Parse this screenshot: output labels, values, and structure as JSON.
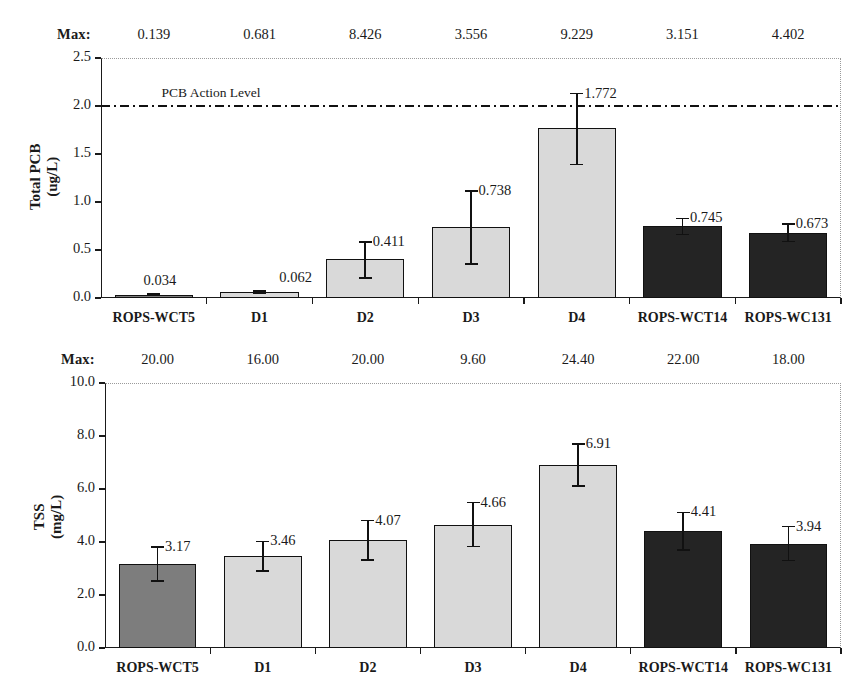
{
  "chart_data": [
    {
      "type": "bar",
      "id": "total-pcb",
      "title": "",
      "xlabel": "",
      "ylabel": "Total PCB (ug/L)",
      "ylabel_line1": "Total PCB",
      "ylabel_line2": "(ug/L)",
      "units": "ug/L",
      "ylim": [
        0.0,
        2.5
      ],
      "ytick_labels": [
        "0.0",
        "0.5",
        "1.0",
        "1.5",
        "2.0",
        "2.5"
      ],
      "ytick_values": [
        0.0,
        0.5,
        1.0,
        1.5,
        2.0,
        2.5
      ],
      "grid": false,
      "legend": "none",
      "max_row_label": "Max:",
      "max_values": [
        "0.139",
        "0.681",
        "8.426",
        "3.556",
        "9.229",
        "3.151",
        "4.402"
      ],
      "categories": [
        "ROPS-WCT5",
        "D1",
        "D2",
        "D3",
        "D4",
        "ROPS-WCT14",
        "ROPS-WC131"
      ],
      "values": [
        0.034,
        0.062,
        0.411,
        0.738,
        1.772,
        0.745,
        0.673
      ],
      "value_labels": [
        "0.034",
        "0.062",
        "0.411",
        "0.738",
        "1.772",
        "0.745",
        "0.673"
      ],
      "err_low": [
        0.028,
        0.05,
        0.207,
        0.355,
        1.39,
        0.66,
        0.59
      ],
      "err_high": [
        0.04,
        0.075,
        0.585,
        1.115,
        2.13,
        0.83,
        0.77
      ],
      "bar_styles": [
        "medium",
        "light",
        "light",
        "light",
        "light",
        "dark",
        "dark"
      ],
      "annotations": [
        {
          "text": "PCB Action Level",
          "y": 2.0,
          "style": "dash-dot-line"
        }
      ],
      "action_level_label": "PCB Action Level",
      "action_level_value": 2.0
    },
    {
      "type": "bar",
      "id": "tss",
      "title": "",
      "xlabel": "",
      "ylabel": "TSS (mg/L)",
      "ylabel_line1": "TSS",
      "ylabel_line2": "(mg/L)",
      "units": "mg/L",
      "ylim": [
        0.0,
        10.0
      ],
      "ytick_labels": [
        "0.0",
        "2.0",
        "4.0",
        "6.0",
        "8.0",
        "10.0"
      ],
      "ytick_values": [
        0.0,
        2.0,
        4.0,
        6.0,
        8.0,
        10.0
      ],
      "grid": false,
      "legend": "none",
      "max_row_label": "Max:",
      "max_values": [
        "20.00",
        "16.00",
        "20.00",
        "9.60",
        "24.40",
        "22.00",
        "18.00"
      ],
      "categories": [
        "ROPS-WCT5",
        "D1",
        "D2",
        "D3",
        "D4",
        "ROPS-WCT14",
        "ROPS-WC131"
      ],
      "values": [
        3.17,
        3.46,
        4.07,
        4.66,
        6.91,
        4.41,
        3.94
      ],
      "value_labels": [
        "3.17",
        "3.46",
        "4.07",
        "4.66",
        "6.91",
        "4.41",
        "3.94"
      ],
      "err_low": [
        2.52,
        2.9,
        3.33,
        3.83,
        6.12,
        3.7,
        3.3
      ],
      "err_high": [
        3.82,
        4.02,
        4.81,
        5.49,
        7.7,
        5.12,
        4.58
      ],
      "bar_styles": [
        "medium",
        "light",
        "light",
        "light",
        "light",
        "dark",
        "dark"
      ],
      "annotations": []
    }
  ],
  "colors": {
    "axis": "#1a1a1a",
    "bar_light": "#d9d9d9",
    "bar_medium": "#7d7d7d",
    "bar_dark": "#242424",
    "bar_border": "#111111",
    "frame_dotted": "#9a9a9a",
    "background": "#ffffff"
  }
}
